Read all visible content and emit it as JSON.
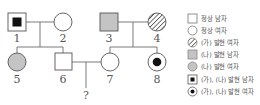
{
  "pedigree": {
    "colors": {
      "line": "#6b6b6b",
      "shade_na": "#c4c4c4",
      "fill_ga": "#111111"
    },
    "individuals": [
      {
        "id": "1",
        "label": "1",
        "sex": "male",
        "phenotype": "(가), (나) 발현"
      },
      {
        "id": "2",
        "label": "2",
        "sex": "female",
        "phenotype": "정상"
      },
      {
        "id": "3",
        "label": "3",
        "sex": "male",
        "phenotype": "(나) 발현"
      },
      {
        "id": "4",
        "label": "4",
        "sex": "female",
        "phenotype": "(가) 발현"
      },
      {
        "id": "5",
        "label": "5",
        "sex": "female",
        "phenotype": "(나) 발현"
      },
      {
        "id": "6",
        "label": "6",
        "sex": "male",
        "phenotype": "정상"
      },
      {
        "id": "7",
        "label": "7",
        "sex": "female",
        "phenotype": "정상"
      },
      {
        "id": "8",
        "label": "8",
        "sex": "female",
        "phenotype": "(가), (나) 발현"
      }
    ],
    "unknown_child_label": "?"
  },
  "legend": {
    "items": [
      {
        "symbol": "square-empty",
        "label": "정상 남자"
      },
      {
        "symbol": "circle-empty",
        "label": "정상 여자"
      },
      {
        "symbol": "circle-hatched",
        "label": "(가) 발현 여자"
      },
      {
        "symbol": "square-gray",
        "label": "(나) 발현 남자"
      },
      {
        "symbol": "circle-gray",
        "label": "(나) 발현 여자"
      },
      {
        "symbol": "square-dot",
        "label": "(가), (나) 발현 남자"
      },
      {
        "symbol": "circle-dot",
        "label": "(가), (나) 발현 여자"
      }
    ]
  }
}
